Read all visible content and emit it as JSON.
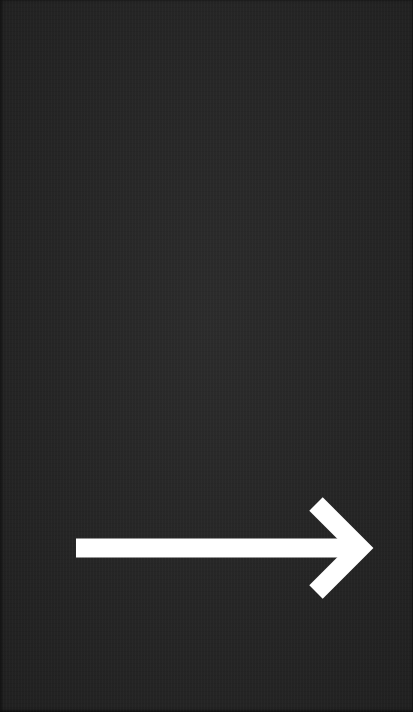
{
  "card": {
    "background_color": "#252525",
    "texture": "paper-grain"
  },
  "arrow": {
    "icon": "arrow-right-icon",
    "direction": "right",
    "color": "#ffffff",
    "stroke_width": 19,
    "shaft": {
      "x1": 76,
      "y1": 548,
      "x2": 360,
      "y2": 548
    },
    "head": {
      "top": {
        "x": 316,
        "y": 504
      },
      "tip": {
        "x": 360,
        "y": 548
      },
      "bottom": {
        "x": 316,
        "y": 592
      }
    }
  }
}
